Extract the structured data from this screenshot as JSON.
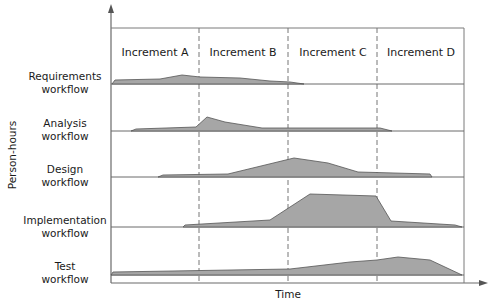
{
  "diagram": {
    "y_axis_label": "Person-hours",
    "x_axis_label": "Time",
    "increments": [
      {
        "label": "Increment A"
      },
      {
        "label": "Increment B"
      },
      {
        "label": "Increment C"
      },
      {
        "label": "Increment D"
      }
    ],
    "workflows": [
      {
        "line1": "Requirements",
        "line2": "workflow"
      },
      {
        "line1": "Analysis",
        "line2": "workflow"
      },
      {
        "line1": "Design",
        "line2": "workflow"
      },
      {
        "line1": "Implementation",
        "line2": "workflow"
      },
      {
        "line1": "Test",
        "line2": "workflow"
      }
    ],
    "colors": {
      "area_fill": "#a6a6a6",
      "area_stroke": "#555555",
      "axis": "#6a6a6a"
    }
  }
}
